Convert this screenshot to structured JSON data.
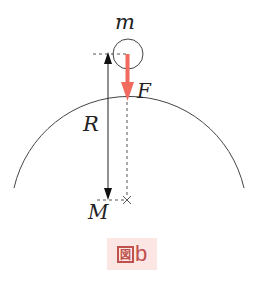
{
  "diagram": {
    "labels": {
      "small_mass": "m",
      "force": "F",
      "radius": "R",
      "large_mass": "M"
    },
    "caption": {
      "prefix_glyph": "図",
      "text": "b"
    },
    "colors": {
      "force_arrow": "#f06a5e",
      "lines": "#333333",
      "caption_bg": "#fbe6e4",
      "caption_text": "#c0504d"
    }
  }
}
